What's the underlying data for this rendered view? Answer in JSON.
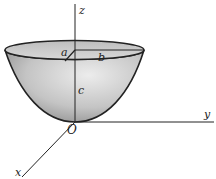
{
  "figure": {
    "labels": {
      "z_axis": "z",
      "y_axis": "y",
      "x_axis": "x",
      "origin": "O",
      "semi_axis_a": "a",
      "semi_axis_b": "b",
      "height_c": "c"
    },
    "colors": {
      "surface_light": "#e6e6e6",
      "surface_dark": "#9a9a9a",
      "rim_fill": "#c9c9c9",
      "stroke": "#222222"
    }
  }
}
